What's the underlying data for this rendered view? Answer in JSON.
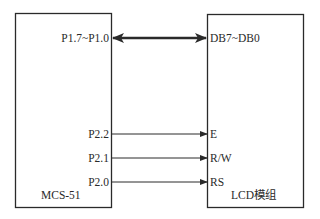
{
  "diagram": {
    "title": "",
    "left_block": {
      "name": "MCS-51",
      "pins": [
        "P1.7~P1.0",
        "P2.2",
        "P2.1",
        "P2.0"
      ]
    },
    "right_block": {
      "name": "LCD模组",
      "pins": [
        "DB7~DB0",
        "E",
        "R/W",
        "RS"
      ]
    },
    "connections": [
      {
        "from": "P1.7~P1.0",
        "to": "DB7~DB0",
        "type": "bidirectional-bus"
      },
      {
        "from": "P2.2",
        "to": "E",
        "type": "unidirectional"
      },
      {
        "from": "P2.1",
        "to": "R/W",
        "type": "unidirectional"
      },
      {
        "from": "P2.0",
        "to": "RS",
        "type": "unidirectional"
      }
    ],
    "colors": {
      "stroke": "#2a2a2a",
      "background": "#ffffff"
    }
  }
}
